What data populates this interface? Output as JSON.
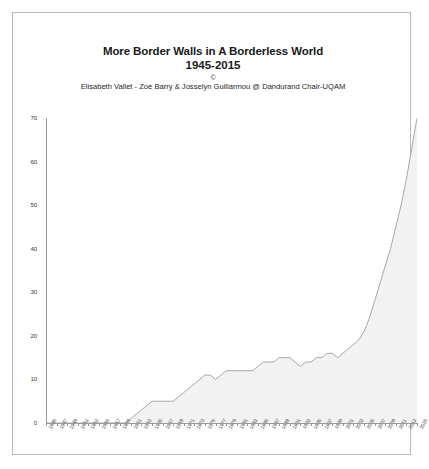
{
  "chart_data": {
    "type": "area",
    "title": "More Border Walls in A Borderless World",
    "subtitle": "1945-2015",
    "copyright_mark": "©",
    "credit": "Elisabeth Vallet - Zoé Barry & Josselyn Guillarmou @ Dandurand Chair-UQAM",
    "xlabel": "",
    "ylabel": "",
    "ylim": [
      0,
      70
    ],
    "xlim": [
      1945,
      2015
    ],
    "ytick_values": [
      0,
      10,
      20,
      30,
      40,
      50,
      60,
      70
    ],
    "ytick_labels": [
      "0",
      "10",
      "20",
      "30",
      "40",
      "50",
      "60",
      "70"
    ],
    "grid": false,
    "legend": "none",
    "series_name": "Border walls",
    "fill_color": "#f2f2f2",
    "line_color": "#9e9e9e",
    "axis_color": "#9a9a9a",
    "xtick_labels": [
      "1945",
      "1947",
      "1949",
      "1951",
      "1953",
      "1955",
      "1957",
      "1959",
      "1961",
      "1963",
      "1965",
      "1967",
      "1969",
      "1971",
      "1973",
      "1975",
      "1977",
      "1979",
      "1981",
      "1983",
      "1985",
      "1987",
      "1989",
      "1991",
      "1993",
      "1995",
      "1997",
      "1999",
      "2001",
      "2003",
      "2005",
      "2007",
      "2009",
      "2011",
      "2013",
      "2015"
    ],
    "x": [
      1945,
      1946,
      1947,
      1948,
      1949,
      1950,
      1951,
      1952,
      1953,
      1954,
      1955,
      1956,
      1957,
      1958,
      1959,
      1960,
      1961,
      1962,
      1963,
      1964,
      1965,
      1966,
      1967,
      1968,
      1969,
      1970,
      1971,
      1972,
      1973,
      1974,
      1975,
      1976,
      1977,
      1978,
      1979,
      1980,
      1981,
      1982,
      1983,
      1984,
      1985,
      1986,
      1987,
      1988,
      1989,
      1990,
      1991,
      1992,
      1993,
      1994,
      1995,
      1996,
      1997,
      1998,
      1999,
      2000,
      2001,
      2002,
      2003,
      2004,
      2005,
      2006,
      2007,
      2008,
      2009,
      2010,
      2011,
      2012,
      2013,
      2014,
      2015
    ],
    "values": [
      0,
      0,
      0,
      0,
      0,
      0,
      0,
      0,
      0,
      0,
      0,
      0,
      0,
      0,
      0,
      0,
      1,
      2,
      3,
      4,
      5,
      5,
      5,
      5,
      5,
      6,
      7,
      8,
      9,
      10,
      11,
      11,
      10,
      11,
      12,
      12,
      12,
      12,
      12,
      12,
      13,
      14,
      14,
      14,
      15,
      15,
      15,
      14,
      13,
      14,
      14,
      15,
      15,
      16,
      16,
      15,
      16,
      17,
      18,
      19,
      21,
      24,
      28,
      32,
      36,
      40,
      45,
      50,
      56,
      63,
      70
    ]
  },
  "icons": {
    "frame": "chart-border"
  }
}
